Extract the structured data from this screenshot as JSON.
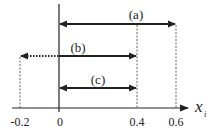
{
  "diagram": {
    "axis": {
      "name": "x",
      "subscript": "i",
      "ticks": [
        {
          "label": "-0.2",
          "value": -0.2
        },
        {
          "label": "0",
          "value": 0
        },
        {
          "label": "0.4",
          "value": 0.4
        },
        {
          "label": "0.6",
          "value": 0.6
        }
      ]
    },
    "intervals": [
      {
        "label": "(a)",
        "from": 0,
        "to": 0.6,
        "style": "solid",
        "arrows": "both"
      },
      {
        "label": "(b)",
        "from": -0.2,
        "to": 0.4,
        "style": "solid right of 0, dotted left of 0",
        "arrows": "both"
      },
      {
        "label": "(c)",
        "from": 0,
        "to": 0.4,
        "style": "solid",
        "arrows": "both"
      }
    ],
    "colors": {
      "ink": "#222222",
      "guide": "#555555",
      "background": "#ffffff"
    }
  }
}
